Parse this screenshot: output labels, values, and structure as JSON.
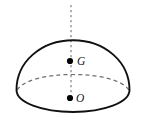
{
  "figure": {
    "background_color": "#ffffff",
    "outline_color": "#111111",
    "hidden_edge_color": "#6f6f6f",
    "axis_color": "#8a8a8a",
    "point_color": "#000000",
    "points": [
      {
        "id": "point-g",
        "label": "G",
        "meaning": "centroid",
        "x": 70,
        "y": 61,
        "label_x": 77,
        "label_y": 65,
        "dot_radius": 3.1
      },
      {
        "id": "point-o",
        "label": "O",
        "meaning": "center of base",
        "x": 70,
        "y": 98,
        "label_x": 76,
        "label_y": 102,
        "dot_radius": 3.1
      }
    ],
    "axis": {
      "name": "axis-of-symmetry",
      "x": 71,
      "y_top": 5,
      "y_bottom": 99,
      "dash": "2.2 2.8",
      "width": 1.3
    },
    "geometry": {
      "apex_x": 73,
      "apex_y": 40,
      "left_x": 16,
      "right_x": 130,
      "rim_y": 90,
      "base_bottom_y": 112,
      "rim_back_peak_y": 79,
      "dome_stroke_width": 1.9,
      "hidden_stroke_width": 1.25,
      "hidden_dash": "4 3.2"
    }
  }
}
